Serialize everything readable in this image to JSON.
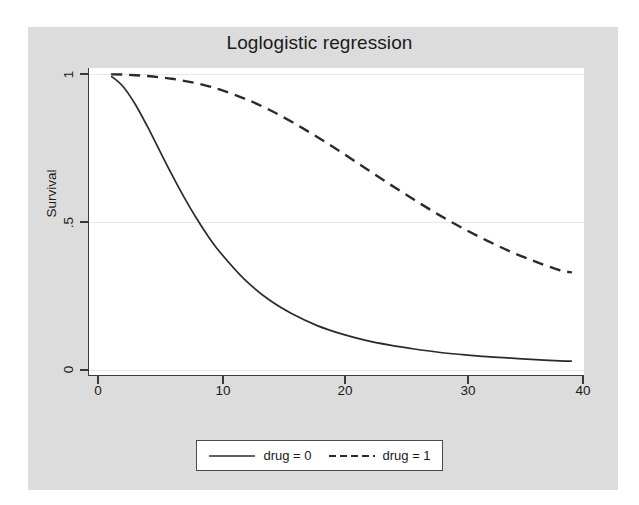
{
  "chart_data": {
    "type": "line",
    "title": "Loglogistic regression",
    "xlabel": "analysis time",
    "ylabel": "Survival",
    "xlim": [
      0,
      40
    ],
    "ylim": [
      0,
      1
    ],
    "grid": true,
    "grid_axis": "y",
    "legend_position": "below",
    "xticks": [
      0,
      10,
      20,
      30,
      40
    ],
    "xtick_labels": [
      "0",
      "10",
      "20",
      "30",
      "40"
    ],
    "yticks": [
      0,
      0.5,
      1
    ],
    "ytick_labels": [
      "0",
      ".5",
      "1"
    ],
    "x": [
      1,
      2,
      3,
      4,
      5,
      6,
      7,
      8,
      9,
      10,
      12,
      14,
      16,
      18,
      20,
      22,
      24,
      26,
      28,
      30,
      32,
      34,
      36,
      38,
      39
    ],
    "series": [
      {
        "name": "drug = 0",
        "label": "drug = 0",
        "style": "solid",
        "color": "#2b2b2b",
        "values": [
          0.993,
          0.957,
          0.897,
          0.822,
          0.741,
          0.661,
          0.585,
          0.515,
          0.452,
          0.397,
          0.306,
          0.238,
          0.188,
          0.15,
          0.122,
          0.1,
          0.084,
          0.071,
          0.06,
          0.052,
          0.045,
          0.04,
          0.035,
          0.031,
          0.03
        ]
      },
      {
        "name": "drug = 1",
        "label": "drug = 1",
        "style": "dashed",
        "color": "#2b2b2b",
        "values": [
          0.999,
          0.998,
          0.996,
          0.993,
          0.989,
          0.984,
          0.977,
          0.969,
          0.959,
          0.947,
          0.917,
          0.88,
          0.836,
          0.787,
          0.735,
          0.681,
          0.627,
          0.575,
          0.525,
          0.479,
          0.437,
          0.399,
          0.366,
          0.337,
          0.33
        ]
      }
    ]
  },
  "legend": {
    "entries": [
      {
        "label": "drug = 0",
        "style": "solid"
      },
      {
        "label": "drug = 1",
        "style": "dashed"
      }
    ]
  }
}
